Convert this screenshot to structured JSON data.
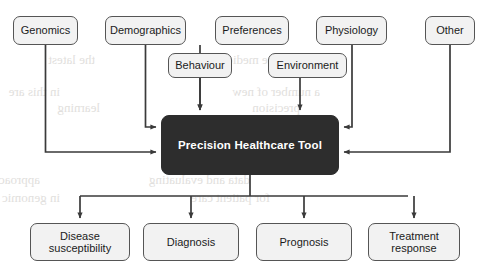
{
  "diagram": {
    "colors": {
      "hub_fill": "#2d2d2d",
      "hub_text": "#ffffff",
      "node_fill": "#f2f2f2",
      "node_border": "#555555",
      "node_text": "#1b1b1b",
      "edge": "#3a3a3a",
      "background": "#ffffff",
      "bleed_text": "#c9c6c2"
    },
    "hub": {
      "label": "Precision Healthcare Tool",
      "x": 161,
      "y": 115,
      "w": 178,
      "h": 60
    },
    "inputs_top_row": [
      {
        "id": "genomics",
        "label": "Genomics",
        "x": 13,
        "y": 16,
        "w": 65,
        "h": 29
      },
      {
        "id": "demographics",
        "label": "Demographics",
        "x": 105,
        "y": 16,
        "w": 81,
        "h": 29
      },
      {
        "id": "preferences",
        "label": "Preferences",
        "x": 215,
        "y": 16,
        "w": 74,
        "h": 29
      },
      {
        "id": "physiology",
        "label": "Physiology",
        "x": 316,
        "y": 16,
        "w": 71,
        "h": 29
      },
      {
        "id": "other",
        "label": "Other",
        "x": 425,
        "y": 16,
        "w": 50,
        "h": 29
      }
    ],
    "inputs_second_row": [
      {
        "id": "behaviour",
        "label": "Behaviour",
        "x": 168,
        "y": 53,
        "w": 64,
        "h": 25
      },
      {
        "id": "environment",
        "label": "Environment",
        "x": 268,
        "y": 53,
        "w": 79,
        "h": 25
      }
    ],
    "outputs": [
      {
        "id": "disease-susceptibility",
        "label": "Disease\nsusceptibility",
        "x": 30,
        "y": 223,
        "w": 100,
        "h": 38
      },
      {
        "id": "diagnosis",
        "label": "Diagnosis",
        "x": 143,
        "y": 223,
        "w": 96,
        "h": 38
      },
      {
        "id": "prognosis",
        "label": "Prognosis",
        "x": 256,
        "y": 223,
        "w": 96,
        "h": 38
      },
      {
        "id": "treatment-response",
        "label": "Treatment\nresponse",
        "x": 368,
        "y": 223,
        "w": 92,
        "h": 38
      }
    ],
    "edges": [
      {
        "from": "demographics",
        "to": "hub",
        "route": "down-right-into-left-edge",
        "enters": "left"
      },
      {
        "from": "genomics",
        "to": "hub",
        "route": "down-right-into-left-edge",
        "enters": "left"
      },
      {
        "from": "preferences",
        "to": "hub",
        "route": "straight-down",
        "enters": "top"
      },
      {
        "from": "behaviour",
        "to": "hub",
        "route": "straight-down",
        "enters": "top"
      },
      {
        "from": "environment",
        "to": "hub",
        "route": "straight-down",
        "enters": "top"
      },
      {
        "from": "physiology",
        "to": "hub",
        "route": "down-left-into-right-edge",
        "enters": "right"
      },
      {
        "from": "other",
        "to": "hub",
        "route": "down-left-into-right-edge",
        "enters": "right"
      },
      {
        "from": "hub",
        "to": "disease-susceptibility",
        "route": "bus-down",
        "enters": "top"
      },
      {
        "from": "hub",
        "to": "diagnosis",
        "route": "bus-down",
        "enters": "top"
      },
      {
        "from": "hub",
        "to": "prognosis",
        "route": "bus-down",
        "enters": "top"
      },
      {
        "from": "hub",
        "to": "treatment-response",
        "route": "bus-down",
        "enters": "top"
      }
    ]
  },
  "background_bleed": [
    {
      "text": "the latest",
      "x": 95,
      "y": 52,
      "size": 13
    },
    {
      "text": "in this are",
      "x": 60,
      "y": 84,
      "size": 13
    },
    {
      "text": "learning",
      "x": 100,
      "y": 100,
      "size": 13
    },
    {
      "text": "approaches and technologies",
      "x": 40,
      "y": 172,
      "size": 13
    },
    {
      "text": "in genomic sequencing",
      "x": 60,
      "y": 190,
      "size": 13
    },
    {
      "text": "and the medicine",
      "x": 300,
      "y": 52,
      "size": 13
    },
    {
      "text": "a number of new",
      "x": 320,
      "y": 84,
      "size": 13
    },
    {
      "text": "precision",
      "x": 300,
      "y": 100,
      "size": 13
    },
    {
      "text": "data and evaluating",
      "x": 250,
      "y": 172,
      "size": 13
    },
    {
      "text": "for patient care",
      "x": 270,
      "y": 190,
      "size": 13
    }
  ]
}
